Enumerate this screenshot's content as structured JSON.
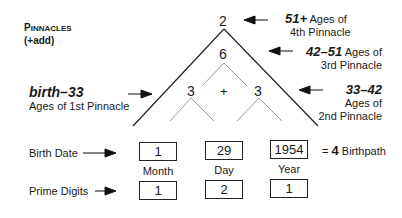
{
  "title": {
    "line1_first": "P",
    "line1_rest": "INNACLES",
    "line2": "(+add)"
  },
  "triangle": {
    "apex": "2",
    "middle": "6",
    "left": "3",
    "plus": "+",
    "right": "3"
  },
  "annotations": {
    "fourth": {
      "range": "51+",
      "text1": "Ages of",
      "text2": "4th Pinnacle"
    },
    "third": {
      "range": "42–51",
      "text1": "Ages of",
      "text2": "3rd Pinnacle"
    },
    "second": {
      "range": "33–42",
      "text1": "Ages of",
      "text2": "2nd Pinnacle"
    },
    "first": {
      "range": "birth–33",
      "text": "Ages of 1st Pinnacle"
    }
  },
  "birth_date": {
    "label": "Birth Date",
    "month": "1",
    "day": "29",
    "year": "1954",
    "result_prefix": "=",
    "result_value": "4",
    "result_label": "Birthpath"
  },
  "captions": {
    "month": "Month",
    "day": "Day",
    "year": "Year"
  },
  "prime_digits": {
    "label": "Prime Digits",
    "month": "1",
    "day": "2",
    "year": "1"
  }
}
